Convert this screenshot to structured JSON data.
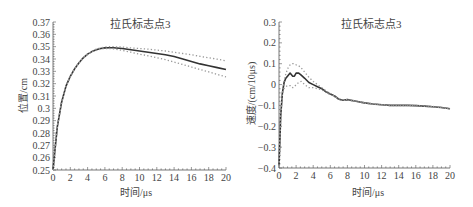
{
  "chart_data": [
    {
      "type": "line",
      "title": "拉氏标志点3",
      "xlabel": "时间/μs",
      "ylabel": "位置/cm",
      "xlim": [
        0,
        20
      ],
      "ylim": [
        0.25,
        0.37
      ],
      "xticks": [
        "0",
        "2",
        "4",
        "6",
        "8",
        "10",
        "12",
        "14",
        "16",
        "18",
        "20"
      ],
      "yticks": [
        "0.25",
        "0.26",
        "0.27",
        "0.28",
        "0.29",
        "0.3",
        "0.31",
        "0.32",
        "0.33",
        "0.34",
        "0.35",
        "0.36",
        "0.37"
      ],
      "grid": false,
      "legend": null,
      "x": [
        0,
        0.5,
        1,
        1.5,
        2,
        2.5,
        3,
        3.5,
        4,
        4.5,
        5,
        5.5,
        6,
        6.5,
        7,
        8,
        9,
        10,
        11,
        12,
        13,
        14,
        15,
        16,
        17,
        18,
        19,
        20
      ],
      "series": [
        {
          "name": "mean",
          "style": "solid-dark",
          "values": [
            0.25,
            0.285,
            0.305,
            0.318,
            0.326,
            0.332,
            0.337,
            0.341,
            0.344,
            0.346,
            0.3475,
            0.3485,
            0.349,
            0.3492,
            0.3492,
            0.3485,
            0.3475,
            0.3465,
            0.3455,
            0.3445,
            0.3435,
            0.342,
            0.34,
            0.338,
            0.336,
            0.3345,
            0.333,
            0.3315
          ]
        },
        {
          "name": "upper bound",
          "style": "dotted-gray",
          "values": [
            0.25,
            0.285,
            0.305,
            0.318,
            0.326,
            0.332,
            0.337,
            0.341,
            0.344,
            0.346,
            0.348,
            0.349,
            0.3497,
            0.35,
            0.35,
            0.3497,
            0.349,
            0.3485,
            0.348,
            0.3472,
            0.3465,
            0.3455,
            0.3445,
            0.3435,
            0.3422,
            0.341,
            0.3398,
            0.3385
          ]
        },
        {
          "name": "lower bound",
          "style": "dotted-gray",
          "values": [
            0.25,
            0.285,
            0.305,
            0.318,
            0.326,
            0.332,
            0.337,
            0.341,
            0.344,
            0.346,
            0.347,
            0.348,
            0.3485,
            0.3485,
            0.3482,
            0.347,
            0.3455,
            0.344,
            0.3425,
            0.341,
            0.3395,
            0.3375,
            0.3355,
            0.3335,
            0.3315,
            0.3295,
            0.3275,
            0.3255
          ]
        }
      ]
    },
    {
      "type": "line",
      "title": "拉氏标志点3",
      "xlabel": "时间/μs",
      "ylabel": "速度/(cm/10μs)",
      "xlim": [
        0,
        20
      ],
      "ylim": [
        -0.4,
        0.3
      ],
      "xticks": [
        "0",
        "2",
        "4",
        "6",
        "8",
        "10",
        "12",
        "14",
        "16",
        "18",
        "20"
      ],
      "yticks": [
        "−0.4",
        "−0.3",
        "−0.2",
        "−0.1",
        "0",
        "0.1",
        "0.2",
        "0.3"
      ],
      "grid": false,
      "legend": null,
      "x": [
        0,
        0.2,
        0.4,
        0.6,
        0.8,
        1,
        1.3,
        1.6,
        1.8,
        2,
        2.3,
        2.6,
        3,
        3.5,
        4,
        4.5,
        5,
        5.5,
        6,
        6.5,
        7,
        7.5,
        8,
        9,
        10,
        11,
        12,
        13,
        14,
        15,
        16,
        17,
        18,
        19,
        20
      ],
      "series": [
        {
          "name": "mean",
          "style": "solid-dark",
          "values": [
            -0.39,
            -0.15,
            -0.04,
            0.01,
            0.03,
            0.04,
            0.055,
            0.04,
            0.04,
            0.055,
            0.055,
            0.045,
            0.03,
            0.01,
            0.0,
            -0.01,
            -0.02,
            -0.035,
            -0.045,
            -0.055,
            -0.07,
            -0.075,
            -0.072,
            -0.08,
            -0.088,
            -0.093,
            -0.097,
            -0.1,
            -0.1,
            -0.1,
            -0.101,
            -0.103,
            -0.106,
            -0.11,
            -0.116
          ]
        },
        {
          "name": "upper bound",
          "style": "dotted-gray",
          "values": [
            -0.39,
            -0.15,
            -0.04,
            0.02,
            0.05,
            0.075,
            0.095,
            0.1,
            0.1,
            0.095,
            0.09,
            0.08,
            0.06,
            0.035,
            0.015,
            0.0,
            -0.015,
            -0.03,
            -0.043,
            -0.055,
            -0.068,
            -0.073,
            -0.071,
            -0.079,
            -0.087,
            -0.092,
            -0.096,
            -0.099,
            -0.099,
            -0.099,
            -0.1,
            -0.102,
            -0.105,
            -0.109,
            -0.115
          ]
        },
        {
          "name": "lower bound",
          "style": "dotted-gray",
          "values": [
            -0.39,
            -0.15,
            -0.05,
            -0.02,
            -0.01,
            -0.005,
            -0.005,
            -0.015,
            -0.01,
            0.0,
            0.01,
            0.015,
            0.0,
            -0.015,
            -0.015,
            -0.02,
            -0.025,
            -0.038,
            -0.048,
            -0.058,
            -0.072,
            -0.077,
            -0.074,
            -0.081,
            -0.089,
            -0.094,
            -0.098,
            -0.101,
            -0.101,
            -0.101,
            -0.102,
            -0.104,
            -0.107,
            -0.111,
            -0.117
          ]
        }
      ]
    }
  ],
  "left_chart": {
    "title": "拉氏标志点3",
    "xlabel": "时间/μs",
    "ylabel": "位置/cm"
  },
  "right_chart": {
    "title": "拉氏标志点3",
    "xlabel": "时间/μs",
    "ylabel": "速度/(cm/10μs)"
  },
  "colors": {
    "mean_line": "#333333",
    "bound_line": "#999999",
    "axis": "#555555"
  }
}
